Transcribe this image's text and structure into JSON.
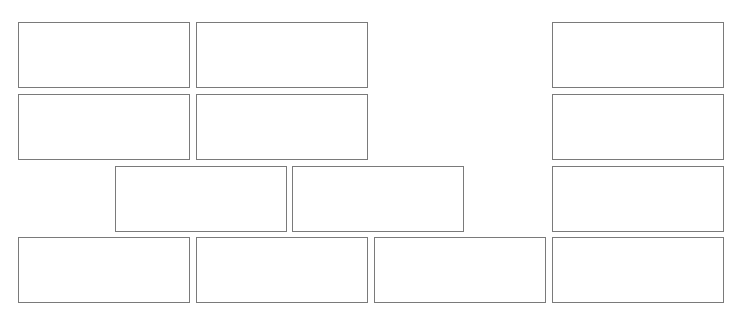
{
  "diagram": {
    "background": "#ffffff",
    "border_color": "#7a7a7a",
    "box_size": {
      "width": 172,
      "height": 66
    },
    "boxes": [
      {
        "id": "r1c1",
        "row": 1,
        "x": 18,
        "y": 22,
        "label": ""
      },
      {
        "id": "r1c2",
        "row": 1,
        "x": 196,
        "y": 22,
        "label": ""
      },
      {
        "id": "r1c4",
        "row": 1,
        "x": 552,
        "y": 22,
        "label": ""
      },
      {
        "id": "r2c1",
        "row": 2,
        "x": 18,
        "y": 94,
        "label": ""
      },
      {
        "id": "r2c2",
        "row": 2,
        "x": 196,
        "y": 94,
        "label": ""
      },
      {
        "id": "r2c4",
        "row": 2,
        "x": 552,
        "y": 94,
        "label": ""
      },
      {
        "id": "r3c1",
        "row": 3,
        "x": 115,
        "y": 166,
        "label": ""
      },
      {
        "id": "r3c2",
        "row": 3,
        "x": 292,
        "y": 166,
        "label": ""
      },
      {
        "id": "r3c4",
        "row": 3,
        "x": 552,
        "y": 166,
        "label": ""
      },
      {
        "id": "r4c1",
        "row": 4,
        "x": 18,
        "y": 237,
        "label": ""
      },
      {
        "id": "r4c2",
        "row": 4,
        "x": 196,
        "y": 237,
        "label": ""
      },
      {
        "id": "r4c3",
        "row": 4,
        "x": 374,
        "y": 237,
        "label": ""
      },
      {
        "id": "r4c4",
        "row": 4,
        "x": 552,
        "y": 237,
        "label": ""
      }
    ],
    "caption": ""
  }
}
